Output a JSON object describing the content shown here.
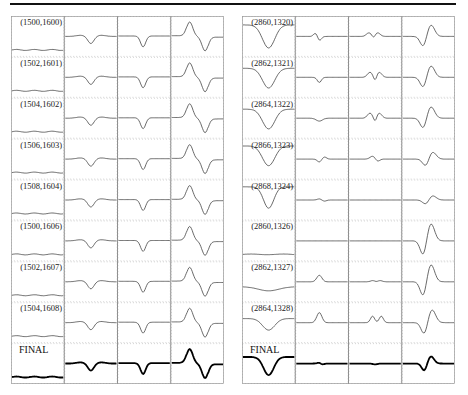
{
  "chart_data": [
    {
      "type": "line",
      "title": "",
      "layout": {
        "rows": 9,
        "cols": 4,
        "grid": true,
        "grid_style": "dotted"
      },
      "row_labels": [
        "(1500,1600)",
        "(1502,1601)",
        "(1504,1602)",
        "(1506,1603)",
        "(1508,1604)",
        "(1500,1606)",
        "(1502,1607)",
        "(1504,1608)",
        "FINAL"
      ],
      "columns": [
        {
          "name": "col1",
          "shape": "nearly flat baseline, slight wobble"
        },
        {
          "name": "col2",
          "shape": "small dip (trough)"
        },
        {
          "name": "col3",
          "shape": "dip (trough)"
        },
        {
          "name": "col4",
          "shape": "tall peak followed by deep trough (dispersive)"
        }
      ],
      "final_row_style": "bold"
    },
    {
      "type": "line",
      "title": "",
      "layout": {
        "rows": 9,
        "cols": 4,
        "grid": true,
        "grid_style": "dotted"
      },
      "row_labels": [
        "(2860,1320)",
        "(2862,1321)",
        "(2864,1322)",
        "(2866,1323)",
        "(2868,1324)",
        "(2860,1326)",
        "(2862,1327)",
        "(2864,1328)",
        "FINAL"
      ],
      "columns": [
        {
          "name": "col1",
          "shape": "broad dip"
        },
        {
          "name": "col2",
          "shape": "small up-down wiggle / peak"
        },
        {
          "name": "col3",
          "shape": "double small peak"
        },
        {
          "name": "col4",
          "shape": "trough then peak (dispersive)"
        }
      ],
      "final_row_style": "bold"
    }
  ],
  "left_panel": {
    "labels": [
      "(1500,1600)",
      "(1502,1601)",
      "(1504,1602)",
      "(1506,1603)",
      "(1508,1604)",
      "(1500,1606)",
      "(1502,1607)",
      "(1504,1608)",
      "FINAL"
    ]
  },
  "right_panel": {
    "labels": [
      "(2860,1320)",
      "(2862,1321)",
      "(2864,1322)",
      "(2866,1323)",
      "(2868,1324)",
      "(2860,1326)",
      "(2862,1327)",
      "(2864,1328)",
      "FINAL"
    ]
  }
}
